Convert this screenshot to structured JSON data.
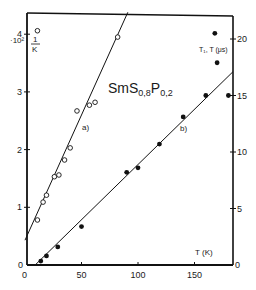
{
  "chart_data": {
    "type": "scatter",
    "title": "SmS0,8P0,2",
    "title_parts": {
      "base": "SmS",
      "sub1": "0,8",
      "mid": "P",
      "sub2": "0,2"
    },
    "xlabel": "T (K)",
    "ylabel_left": "1/K",
    "ylabel_left_scale": "·10²",
    "ylabel_right": "T₁, T (μs)",
    "xlim": [
      0,
      185
    ],
    "ylim_left": [
      0,
      4.6
    ],
    "ylim_right": [
      0,
      22.3
    ],
    "x_ticks": [
      "0",
      "50",
      "100",
      "150"
    ],
    "x_tick_values": [
      0,
      50,
      100,
      150
    ],
    "y_left_ticks": [
      "0",
      "1",
      "2",
      "3",
      "4"
    ],
    "y_left_tick_values": [
      0,
      1,
      2,
      3,
      4
    ],
    "y_right_ticks": [
      "0",
      "5",
      "10",
      "15",
      "20"
    ],
    "y_right_tick_values": [
      0,
      5,
      10,
      15,
      20
    ],
    "grid": false,
    "series": [
      {
        "name": "a)",
        "axis": "left",
        "marker": "open-circle",
        "quantity": "1/K (×10²)",
        "x": [
          11,
          11,
          16,
          19,
          26,
          30,
          35,
          40,
          46,
          57,
          62,
          82
        ],
        "y": [
          4.06,
          0.78,
          1.09,
          1.21,
          1.53,
          1.56,
          1.82,
          2.03,
          2.67,
          2.77,
          2.82,
          3.95
        ],
        "fit_line": {
          "x": [
            0,
            91
          ],
          "y": [
            0.43,
            4.38
          ]
        }
      },
      {
        "name": "b)",
        "axis": "right",
        "marker": "filled-circle",
        "quantity": "T₁, T (μs)",
        "x": [
          14,
          19,
          29,
          50,
          90,
          100,
          119,
          140,
          160,
          168,
          170,
          180
        ],
        "y": [
          0.35,
          0.8,
          1.6,
          3.4,
          8.2,
          8.6,
          10.7,
          13.1,
          15.0,
          20.5,
          17.9,
          15.0
        ],
        "fit_line": {
          "x": [
            9,
            184
          ],
          "y": [
            0,
            17.1
          ]
        }
      }
    ],
    "annotations": [
      "a)",
      "b)"
    ]
  },
  "labels": {
    "title_base": "SmS",
    "title_sub1": "0,8",
    "title_mid": "P",
    "title_sub2": "0,2",
    "xlabel": "T (K)",
    "left_unit_num": "1",
    "left_unit_den": "K",
    "left_scale": "·10²",
    "right_unit": "T₁, T (μs)",
    "series_a": "a)",
    "series_b": "b)",
    "corner_left_zero": "0",
    "corner_right_zero": "0"
  }
}
